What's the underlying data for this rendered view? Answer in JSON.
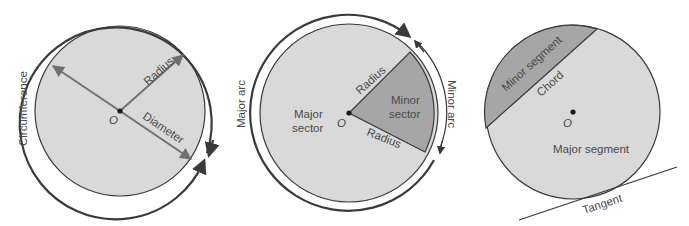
{
  "colors": {
    "light_fill": "#d9d9d9",
    "dark_fill": "#a6a6a6",
    "stroke": "#3a3a3a",
    "arrow": "#707070",
    "text": "#4a4a4a"
  },
  "diagrams": [
    {
      "name": "circle-parts",
      "labels": {
        "circumference": "Circumference",
        "radius": "Radius",
        "diameter": "Diameter",
        "center": "O"
      }
    },
    {
      "name": "arcs-and-sectors",
      "labels": {
        "major_arc": "Major arc",
        "minor_arc": "Minor arc",
        "radius_top": "Radius",
        "radius_bottom": "Radius",
        "major_sector_line1": "Major",
        "major_sector_line2": "sector",
        "minor_sector_line1": "Minor",
        "minor_sector_line2": "sector",
        "center": "O"
      }
    },
    {
      "name": "segments-chord-tangent",
      "labels": {
        "minor_segment": "Minor segment",
        "chord": "Chord",
        "major_segment": "Major segment",
        "tangent": "Tangent",
        "center": "O"
      }
    }
  ]
}
